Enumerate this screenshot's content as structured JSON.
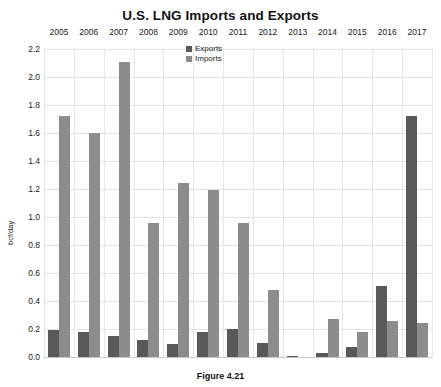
{
  "chart_data": {
    "type": "bar",
    "title": "U.S. LNG Imports and Exports",
    "xlabel": "",
    "ylabel": "bcf/day",
    "ylim": [
      0.0,
      2.2
    ],
    "yticks": [
      "0.0",
      "0.2",
      "0.4",
      "0.6",
      "0.8",
      "1.0",
      "1.2",
      "1.4",
      "1.6",
      "1.8",
      "2.0",
      "2.2"
    ],
    "grid": true,
    "legend_position": "inside-top-center",
    "categories": [
      "2005",
      "2006",
      "2007",
      "2008",
      "2009",
      "2010",
      "2011",
      "2012",
      "2013",
      "2014",
      "2015",
      "2016",
      "2017"
    ],
    "series": [
      {
        "name": "Exports",
        "color": "#595959",
        "values": [
          0.19,
          0.18,
          0.15,
          0.12,
          0.09,
          0.18,
          0.2,
          0.1,
          0.01,
          0.03,
          0.07,
          0.51,
          1.72
        ]
      },
      {
        "name": "Imports",
        "color": "#8c8c8c",
        "values": [
          1.72,
          1.6,
          2.11,
          0.96,
          1.24,
          1.19,
          0.96,
          0.48,
          0.0,
          0.27,
          0.18,
          0.26,
          0.24
        ]
      }
    ]
  },
  "caption": "Figure 4.21",
  "colors": {
    "exports": "#595959",
    "imports": "#8c8c8c",
    "gridline": "#e2e2e2",
    "background": "#ffffff"
  }
}
